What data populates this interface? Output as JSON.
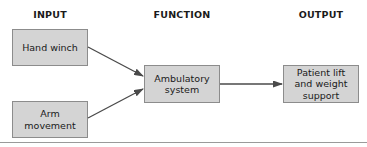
{
  "headers": {
    "input": "INPUT",
    "function": "FUNCTION",
    "output": "OUTPUT"
  },
  "nodes": {
    "hand_winch": "Hand winch",
    "arm_movement": "Arm movement",
    "ambulatory_system": "Ambulatory system",
    "patient_lift": "Patient lift and weight support"
  },
  "edges": [
    {
      "from": "Hand winch",
      "to": "Ambulatory system"
    },
    {
      "from": "Arm movement",
      "to": "Ambulatory system"
    },
    {
      "from": "Ambulatory system",
      "to": "Patient lift and weight support"
    }
  ],
  "colors": {
    "box_fill": "#d4d4d4",
    "box_border": "#8c8c8c",
    "arrow": "#4a4a4a"
  }
}
